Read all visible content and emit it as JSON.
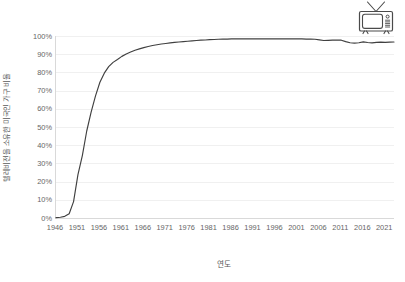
{
  "chart_data": {
    "type": "line",
    "title": "",
    "xlabel": "연도",
    "ylabel": "텔레비전을 소유한 미국인 가구 비율",
    "xlim": [
      1946,
      2023
    ],
    "ylim": [
      0,
      1.0
    ],
    "grid": true,
    "legend": null,
    "line_color": "#404040",
    "xticks": [
      "1946",
      "1951",
      "1956",
      "1961",
      "1966",
      "1971",
      "1976",
      "1981",
      "1986",
      "1991",
      "1996",
      "2001",
      "2006",
      "2011",
      "2016",
      "2021"
    ],
    "yticks": [
      "0%",
      "10%",
      "20%",
      "30%",
      "40%",
      "50%",
      "60%",
      "70%",
      "80%",
      "90%",
      "100%"
    ],
    "ytick_values": [
      0,
      0.1,
      0.2,
      0.3,
      0.4,
      0.5,
      0.6,
      0.7,
      0.8,
      0.9,
      1.0
    ],
    "x": [
      1946,
      1947,
      1948,
      1949,
      1950,
      1951,
      1952,
      1953,
      1954,
      1955,
      1956,
      1957,
      1958,
      1959,
      1960,
      1961,
      1962,
      1963,
      1964,
      1965,
      1966,
      1967,
      1968,
      1969,
      1970,
      1971,
      1972,
      1973,
      1974,
      1975,
      1976,
      1977,
      1978,
      1979,
      1980,
      1981,
      1982,
      1983,
      1984,
      1985,
      1986,
      1987,
      1988,
      1989,
      1990,
      1991,
      1992,
      1993,
      1994,
      1995,
      1996,
      1997,
      1998,
      1999,
      2000,
      2001,
      2002,
      2003,
      2004,
      2005,
      2006,
      2007,
      2008,
      2009,
      2010,
      2011,
      2012,
      2013,
      2014,
      2015,
      2016,
      2017,
      2018,
      2019,
      2020,
      2021,
      2022,
      2023
    ],
    "values": [
      0.002,
      0.004,
      0.009,
      0.023,
      0.09,
      0.238,
      0.343,
      0.478,
      0.582,
      0.671,
      0.746,
      0.796,
      0.832,
      0.855,
      0.871,
      0.888,
      0.901,
      0.912,
      0.922,
      0.929,
      0.936,
      0.942,
      0.948,
      0.952,
      0.956,
      0.959,
      0.962,
      0.965,
      0.967,
      0.969,
      0.971,
      0.973,
      0.975,
      0.977,
      0.978,
      0.98,
      0.981,
      0.982,
      0.983,
      0.983,
      0.984,
      0.984,
      0.984,
      0.984,
      0.984,
      0.984,
      0.984,
      0.984,
      0.984,
      0.984,
      0.984,
      0.984,
      0.984,
      0.984,
      0.984,
      0.984,
      0.984,
      0.983,
      0.983,
      0.982,
      0.979,
      0.975,
      0.976,
      0.977,
      0.978,
      0.977,
      0.969,
      0.963,
      0.961,
      0.963,
      0.968,
      0.964,
      0.962,
      0.965,
      0.966,
      0.965,
      0.966,
      0.967
    ],
    "series_name": "텔레비전을 소유한 미국인 가구 비율"
  },
  "icons": {
    "tv": "television-icon"
  }
}
